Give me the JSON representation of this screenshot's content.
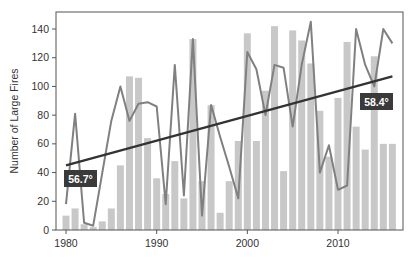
{
  "chart_data": {
    "type": "bar+line",
    "title": "",
    "xlabel": "",
    "ylabel": "Number of Large Fires",
    "ylim": [
      0,
      150
    ],
    "yticks": [
      0,
      20,
      40,
      60,
      80,
      100,
      120,
      140
    ],
    "xticks": [
      1980,
      1990,
      2000,
      2010
    ],
    "x": [
      1980,
      1981,
      1982,
      1983,
      1984,
      1985,
      1986,
      1987,
      1988,
      1989,
      1990,
      1991,
      1992,
      1993,
      1994,
      1995,
      1996,
      1997,
      1998,
      1999,
      2000,
      2001,
      2002,
      2003,
      2004,
      2005,
      2006,
      2007,
      2008,
      2009,
      2010,
      2011,
      2012,
      2013,
      2014,
      2015,
      2016
    ],
    "series": [
      {
        "name": "Number of large fires (bars)",
        "type": "bar",
        "color": "#c8c8c8",
        "values": [
          10,
          15,
          4,
          2,
          6,
          15,
          45,
          107,
          106,
          64,
          36,
          25,
          48,
          22,
          133,
          34,
          87,
          12,
          34,
          62,
          137,
          62,
          97,
          142,
          41,
          139,
          132,
          116,
          83,
          51,
          92,
          131,
          72,
          56,
          121,
          60,
          60
        ]
      },
      {
        "name": "Temperature (line)",
        "type": "line",
        "color": "#808080",
        "values": [
          18,
          81,
          5,
          3,
          40,
          76,
          100,
          76,
          88,
          89,
          86,
          18,
          115,
          24,
          133,
          10,
          87,
          65,
          44,
          22,
          124,
          112,
          80,
          115,
          113,
          72,
          115,
          145,
          40,
          59,
          28,
          31,
          140,
          115,
          100,
          140,
          130
        ]
      },
      {
        "name": "Trend",
        "type": "line",
        "color": "#333333",
        "x": [
          1980,
          2016
        ],
        "values": [
          45,
          107
        ]
      }
    ],
    "annotations": [
      {
        "text": "56.7°",
        "x": 1981.5,
        "y": 34
      },
      {
        "text": "58.4°",
        "x": 2014.3,
        "y": 81
      }
    ],
    "grid": false,
    "legend": "none"
  },
  "labels": {
    "ylabel": "Number of Large Fires",
    "yticks": [
      "0",
      "20",
      "40",
      "60",
      "80",
      "100",
      "120",
      "140"
    ],
    "xticks": [
      "1980",
      "1990",
      "2000",
      "2010"
    ],
    "badge_start": "56.7°",
    "badge_end": "58.4°"
  }
}
